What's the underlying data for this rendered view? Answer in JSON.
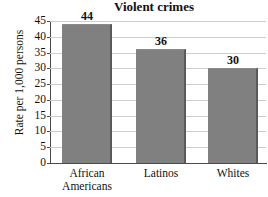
{
  "chart_data": {
    "type": "bar",
    "title": "Violent crimes",
    "xlabel": "",
    "ylabel": "Rate per 1,000 persons",
    "categories": [
      "African Americans",
      "Latinos",
      "Whites"
    ],
    "category_lines": [
      [
        "African",
        "Americans"
      ],
      [
        "Latinos"
      ],
      [
        "Whites"
      ]
    ],
    "values": [
      44,
      36,
      30
    ],
    "value_labels": [
      "44",
      "36",
      "30"
    ],
    "ylim": [
      0,
      45
    ],
    "ytick_step": 5,
    "ytick_labels": [
      "45",
      "40",
      "35",
      "30",
      "25",
      "20",
      "15",
      "10",
      "5",
      "0"
    ],
    "ytick_values": [
      45,
      40,
      35,
      30,
      25,
      20,
      15,
      10,
      5,
      0
    ],
    "grid": "horizontal",
    "legend": "none",
    "colors": {
      "bar_fill": "#808080",
      "bar_shadow": "#5a5a5a",
      "gridline": "#cfcfcf",
      "axis": "#4a4a4a",
      "text": "#111111",
      "background": "#ffffff"
    }
  }
}
